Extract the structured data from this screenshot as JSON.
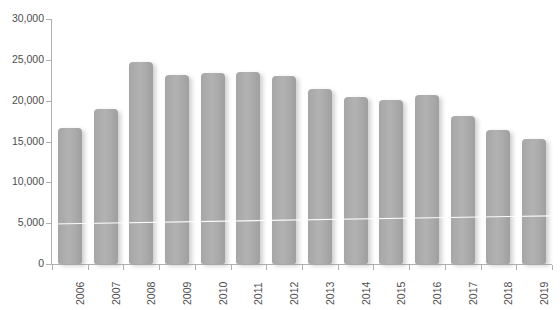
{
  "chart_data": {
    "type": "bar",
    "title": "",
    "xlabel": "",
    "ylabel": "",
    "categories": [
      "2006",
      "2007",
      "2008",
      "2009",
      "2010",
      "2011",
      "2012",
      "2013",
      "2014",
      "2015",
      "2016",
      "2017",
      "2018",
      "2019"
    ],
    "values": [
      16650,
      19000,
      24700,
      23100,
      23400,
      23500,
      23000,
      21400,
      20450,
      20100,
      20700,
      18100,
      16400,
      15300
    ],
    "ylim": [
      0,
      30000
    ],
    "ytick_labels": [
      "0",
      "5,000",
      "10,000",
      "15,000",
      "20,000",
      "25,000",
      "30,000"
    ],
    "ytick_values": [
      0,
      5000,
      10000,
      15000,
      20000,
      25000,
      30000
    ],
    "grid": false,
    "legend": "none",
    "bar_color": "#ababab",
    "axis_color": "#b0b0b0",
    "text_color": "#4d4d4d",
    "annotations": [
      {
        "name": "trend-line",
        "color": "#ffffff",
        "start_value": 4900,
        "end_value": 5900
      }
    ]
  }
}
